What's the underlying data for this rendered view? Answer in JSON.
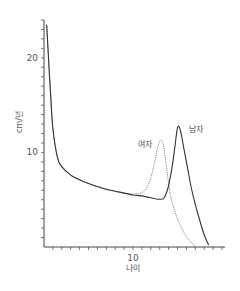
{
  "chart_data": {
    "type": "line",
    "title": "",
    "xlabel": "나이",
    "ylabel": "cm/년",
    "xlim": [
      0,
      20
    ],
    "ylim": [
      0,
      24
    ],
    "x_ticks": [
      10
    ],
    "y_ticks": [
      10,
      20
    ],
    "x_minor_step": 1,
    "y_minor_step": 1,
    "grid": false,
    "legend": "inline labels near peaks",
    "series": [
      {
        "name": "남자",
        "style": "solid",
        "color": "#333333",
        "x": [
          0.3,
          0.5,
          0.75,
          1,
          1.5,
          2,
          3,
          4,
          5,
          6,
          7,
          8,
          9,
          10,
          11,
          11.5,
          12,
          12.5,
          13,
          13.5,
          14,
          14.4,
          14.7,
          15,
          15.3,
          15.8,
          16.5,
          17,
          17.5,
          18,
          18.5
        ],
        "values": [
          23.5,
          20,
          16,
          12.5,
          9.5,
          8.5,
          7.6,
          7.1,
          6.7,
          6.4,
          6.1,
          5.9,
          5.7,
          5.5,
          5.4,
          5.3,
          5.2,
          5.1,
          5.05,
          5.2,
          6.5,
          8.5,
          10.5,
          12.6,
          12.4,
          10,
          6.5,
          4.5,
          2.8,
          1.3,
          0.2
        ],
        "label_text": "남자",
        "label_position": [
          16.3,
          12.2
        ]
      },
      {
        "name": "여자",
        "style": "dotted",
        "color": "#8a8a8a",
        "x": [
          0.3,
          0.5,
          0.75,
          1,
          1.5,
          2,
          3,
          4,
          5,
          6,
          7,
          8,
          9,
          10,
          10.5,
          11,
          11.5,
          12,
          12.5,
          12.8,
          13.1,
          13.4,
          13.8,
          14.2,
          14.7,
          15.2,
          15.8,
          16.4,
          17
        ],
        "values": [
          23.5,
          20,
          16,
          12.5,
          9.5,
          8.5,
          7.6,
          7.1,
          6.7,
          6.4,
          6.1,
          5.9,
          5.7,
          5.6,
          5.6,
          5.7,
          6.2,
          7.3,
          9.3,
          10.6,
          11.3,
          10.8,
          8.2,
          5.5,
          3.8,
          2.5,
          1.4,
          0.6,
          0.1
        ],
        "label_text": "여자",
        "label_position": [
          10.6,
          10.6
        ]
      }
    ]
  },
  "axes": {
    "x_tick_label_10": "10",
    "y_tick_label_10": "10",
    "y_tick_label_20": "20",
    "x_title": "나이",
    "y_title": "cm/년"
  },
  "labels": {
    "male": "남자",
    "female": "여자"
  }
}
